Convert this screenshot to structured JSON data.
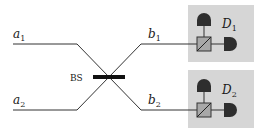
{
  "diagram": {
    "colors": {
      "line": "#333333",
      "box_fill": "#d6d6d6",
      "detector_fill": "#2e2e2e",
      "pbs_fill": "#a8a8a8",
      "bs_bar": "#111111"
    },
    "inputs": [
      {
        "id": "a1",
        "base": "a",
        "sub": "1"
      },
      {
        "id": "a2",
        "base": "a",
        "sub": "2"
      }
    ],
    "outputs": [
      {
        "id": "b1",
        "base": "b",
        "sub": "1"
      },
      {
        "id": "b2",
        "base": "b",
        "sub": "2"
      }
    ],
    "beam_splitter": {
      "label": "BS"
    },
    "detectors": [
      {
        "id": "D1",
        "base": "D",
        "sub": "1"
      },
      {
        "id": "D2",
        "base": "D",
        "sub": "2"
      }
    ]
  }
}
